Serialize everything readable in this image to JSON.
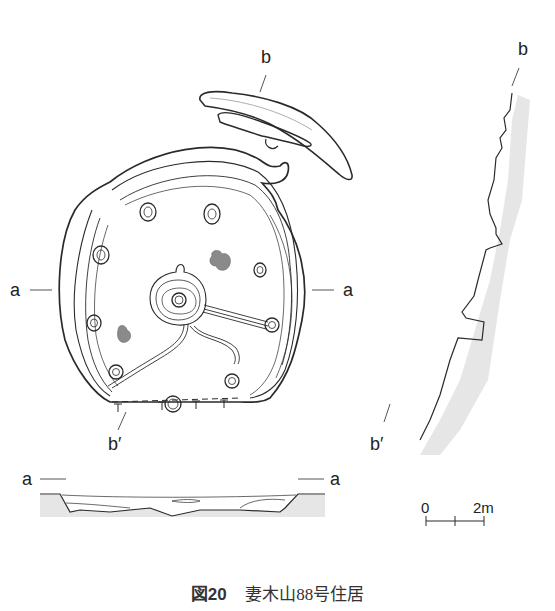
{
  "figure": {
    "number": "図20",
    "title": "妻木山88号住居"
  },
  "plan": {
    "section_labels": {
      "a_left": "a",
      "a_right": "a",
      "b_top": "b",
      "b_bottom": "b′"
    }
  },
  "profile_a": {
    "label_left": "a",
    "label_right": "a"
  },
  "profile_b": {
    "label_top": "b",
    "label_bottom": "b′"
  },
  "scale_bar": {
    "start": "0",
    "end": "2m"
  },
  "colors": {
    "line": "#2a2a2a",
    "fill_gray": "#8a8a8a",
    "section_shade": "#e6e6e6"
  }
}
